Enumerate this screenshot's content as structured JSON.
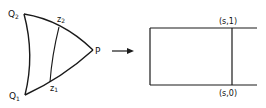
{
  "diagram": {
    "left_region": {
      "vertices": {
        "Q2": {
          "label": "Q",
          "sub": "2"
        },
        "Q1": {
          "label": "Q",
          "sub": "1"
        },
        "P": {
          "label": "P"
        }
      },
      "curve_points": {
        "z2": {
          "label": "z",
          "sub": "2"
        },
        "z1": {
          "label": "z",
          "sub": "1"
        }
      }
    },
    "arrow": {
      "direction": "right"
    },
    "right_region": {
      "shape": "strip",
      "top_label": "(s,1)",
      "bottom_label": "(s,0)"
    },
    "colors": {
      "stroke": "#1a1a1a",
      "background": "#ffffff"
    }
  }
}
